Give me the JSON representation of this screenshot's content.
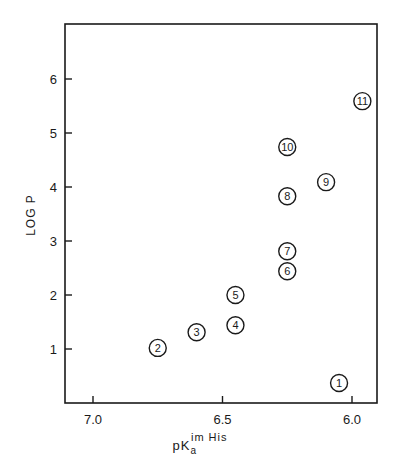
{
  "chart_data": {
    "type": "scatter",
    "title": "",
    "xlabel": "pKa im His",
    "xlabel_parts": {
      "main": "pK",
      "sub": "a",
      "sup": "im His"
    },
    "ylabel": "LOG P",
    "xlim": [
      7.1,
      5.9
    ],
    "x_reversed": true,
    "ylim": [
      0,
      6.9
    ],
    "xticks": [
      7.0,
      6.5,
      6.0
    ],
    "xtick_labels": [
      "7.0",
      "6.5",
      "6.0"
    ],
    "yticks": [
      1,
      2,
      3,
      4,
      5,
      6
    ],
    "ytick_labels": [
      "1",
      "2",
      "3",
      "4",
      "5",
      "6"
    ],
    "grid": false,
    "legend": null,
    "marker": "circled-number",
    "points": [
      {
        "label": "1",
        "x": 6.05,
        "y": 0.37
      },
      {
        "label": "2",
        "x": 6.75,
        "y": 1.02
      },
      {
        "label": "3",
        "x": 6.6,
        "y": 1.31
      },
      {
        "label": "4",
        "x": 6.45,
        "y": 1.44
      },
      {
        "label": "5",
        "x": 6.45,
        "y": 2.0
      },
      {
        "label": "6",
        "x": 6.25,
        "y": 2.44
      },
      {
        "label": "7",
        "x": 6.25,
        "y": 2.81
      },
      {
        "label": "8",
        "x": 6.25,
        "y": 3.83
      },
      {
        "label": "9",
        "x": 6.1,
        "y": 4.09
      },
      {
        "label": "10",
        "x": 6.25,
        "y": 4.74
      },
      {
        "label": "11",
        "x": 5.96,
        "y": 5.59
      }
    ]
  },
  "colors": {
    "ink": "#1a1a1a",
    "background": "#ffffff"
  }
}
